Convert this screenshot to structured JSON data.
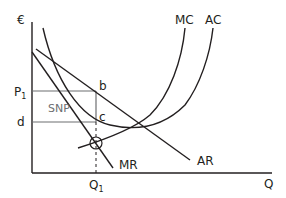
{
  "diagram": {
    "y_axis_label": "€",
    "x_axis_label": "Q",
    "price_label": "P",
    "price_sub": "1",
    "cost_label": "d",
    "quantity_label": "Q",
    "quantity_sub": "1",
    "point_b": "b",
    "point_c": "c",
    "area_label": "SNP",
    "curves": {
      "mc": "MC",
      "ac": "AC",
      "ar": "AR",
      "mr": "MR"
    },
    "colors": {
      "line": "#231f20",
      "grid": "#6d6e71"
    }
  }
}
